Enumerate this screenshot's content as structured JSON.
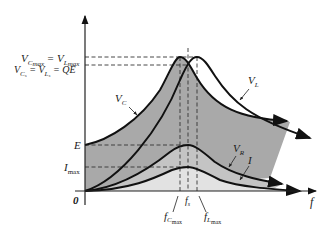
{
  "diagram": {
    "type": "series-resonance-frequency-response",
    "axes": {
      "x_label": "f",
      "origin_label": "0"
    },
    "y_levels": {
      "vcmax": {
        "left": "V",
        "left_sub": "C",
        "left_sub2": "max",
        "eq": " = V",
        "right_sub": "L",
        "right_sub2": "max"
      },
      "vcs": {
        "text_a": "V",
        "sub_a": "C",
        "sub_a2": "s",
        "eq1": " = V",
        "sub_b": "L",
        "sub_b2": "s",
        "eq2": " = QE"
      },
      "e": "E",
      "imax": {
        "main": "I",
        "sub": "max"
      }
    },
    "x_marks": {
      "fcmax": {
        "main": "f",
        "sub": "C",
        "sub2": "max"
      },
      "fs": {
        "main": "f",
        "sub": "s"
      },
      "flmax": {
        "main": "f",
        "sub": "L",
        "sub2": "max"
      }
    },
    "curves": {
      "vc": {
        "main": "V",
        "sub": "C"
      },
      "vl": {
        "main": "V",
        "sub": "L"
      },
      "vr": {
        "main": "V",
        "sub": "R"
      },
      "i": {
        "main": "I"
      }
    },
    "colors": {
      "dark_fill": "#a9a9a9",
      "mid_fill": "#c4c4c4",
      "light_fill": "#e2e2e2",
      "line": "#111111"
    }
  }
}
